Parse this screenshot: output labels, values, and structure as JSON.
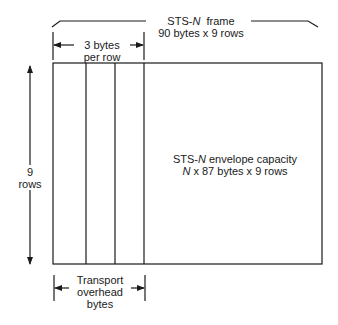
{
  "diagram": {
    "frame_label": {
      "line1_prefix": "STS-",
      "line1_var": "N",
      "line1_suffix": "frame",
      "line2": "90 bytes x 9 rows"
    },
    "overhead_width_label": {
      "line1": "3 bytes",
      "line2": "per row"
    },
    "rows_label": {
      "line1": "9",
      "line2": "rows"
    },
    "envelope_label": {
      "line1_prefix": "STS-",
      "line1_var": "N",
      "line1_suffix": "envelope capacity",
      "line2_var": "N",
      "line2_suffix": "x 87 bytes x 9 rows"
    },
    "transport_overhead_label": {
      "line1": "Transport",
      "line2": "overhead",
      "line3": "bytes"
    },
    "stroke_color": "#1a1a1a"
  }
}
